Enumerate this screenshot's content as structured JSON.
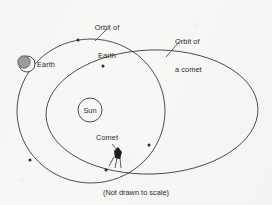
{
  "figure": {
    "kind": "astronomy-orbit-diagram",
    "caption": "(Not drawn to scale)",
    "background_color": "#f7f7f6",
    "ink_color": "#3b3b3b"
  },
  "labels": {
    "orbit_of_earth_line1": "Orbit of",
    "orbit_of_earth_line2": "Earth",
    "orbit_of_comet_line1": "Orbit of",
    "orbit_of_comet_line2": "a comet",
    "earth": "Earth",
    "sun": "Sun",
    "comet": "Comet"
  },
  "bodies": [
    {
      "name": "sun",
      "label": "Sun",
      "cx": 90,
      "cy": 110,
      "r": 12,
      "style": "open-circle-with-text"
    },
    {
      "name": "earth",
      "label": "Earth",
      "cx": 26,
      "cy": 64,
      "r": 8,
      "style": "shaded-disc-on-open-circle",
      "shade_color": "#9c9c9c"
    },
    {
      "name": "comet",
      "label": "Comet",
      "cx": 118,
      "cy": 152,
      "style": "dark-head-with-tail",
      "head_color": "#1d1d1d"
    }
  ],
  "orbits": [
    {
      "name": "orbit-of-earth",
      "label": "Orbit of Earth",
      "shape": "ellipse",
      "cx": 91,
      "cy": 111,
      "rx": 74,
      "ry": 72,
      "rotation_deg": 0,
      "markers": [
        {
          "x": 78,
          "y": 40
        },
        {
          "x": 30,
          "y": 160
        },
        {
          "x": 149,
          "y": 145
        }
      ]
    },
    {
      "name": "orbit-of-a-comet",
      "label": "Orbit of a comet",
      "shape": "ellipse",
      "cx": 152,
      "cy": 112,
      "rx": 106,
      "ry": 62,
      "rotation_deg": -2,
      "markers": [
        {
          "x": 103,
          "y": 66
        },
        {
          "x": 106,
          "y": 170
        }
      ]
    }
  ],
  "leaders": [
    {
      "name": "leader-orbit-of-earth",
      "from_x": 107,
      "from_y": 28,
      "to_x": 95,
      "to_y": 40
    },
    {
      "name": "leader-orbit-of-a-comet",
      "from_x": 178,
      "from_y": 42,
      "to_x": 166,
      "to_y": 57
    },
    {
      "name": "leader-comet",
      "from_x": 113,
      "from_y": 146,
      "to_x": 118,
      "to_y": 152
    }
  ]
}
